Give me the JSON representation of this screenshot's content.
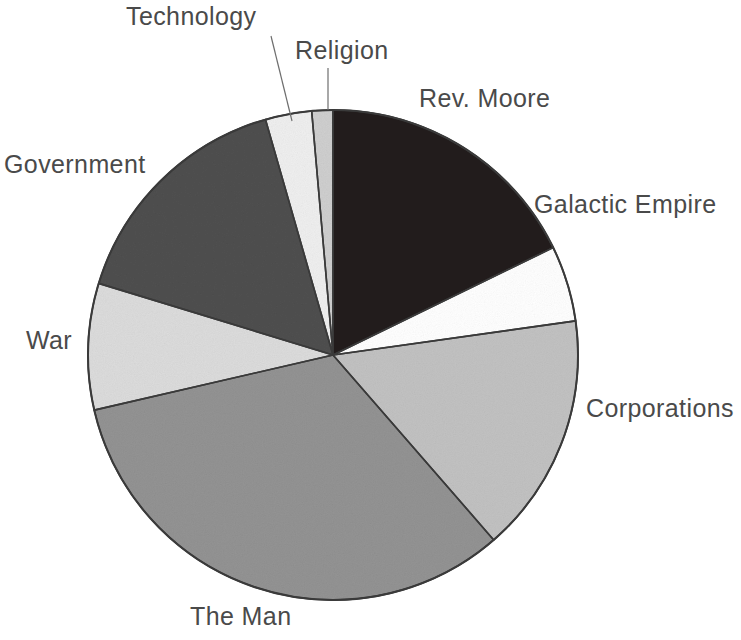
{
  "chart_data": {
    "type": "pie",
    "title": "",
    "subtitle": "",
    "xlabel": "",
    "ylabel": "",
    "legend_position": "none",
    "grid": false,
    "labels_outside": true,
    "start_angle_deg": 0,
    "direction": "clockwise",
    "center": {
      "x": 333,
      "y": 355
    },
    "radius": 245,
    "categories": [
      "Rev. Moore",
      "Galactic Empire",
      "Corporations",
      "The Man",
      "War",
      "Government",
      "Technology",
      "Religion"
    ],
    "values": [
      17.8,
      5.0,
      15.8,
      32.8,
      8.3,
      15.8,
      3.1,
      1.4
    ],
    "slices": [
      {
        "label": "Rev. Moore",
        "value": 17.8,
        "start_deg": 0,
        "end_deg": 64,
        "color": "#221f1f",
        "swatch_name": "near-black"
      },
      {
        "label": "Galactic Empire",
        "value": 5.0,
        "start_deg": 64,
        "end_deg": 82,
        "color": "#ffffff",
        "swatch_name": "white"
      },
      {
        "label": "Corporations",
        "value": 15.8,
        "start_deg": 82,
        "end_deg": 139,
        "color": "#c2c2c2",
        "swatch_name": "light-gray"
      },
      {
        "label": "The Man",
        "value": 32.8,
        "start_deg": 139,
        "end_deg": 257,
        "color": "#939393",
        "swatch_name": "medium-gray"
      },
      {
        "label": "War",
        "value": 8.3,
        "start_deg": 257,
        "end_deg": 287,
        "color": "#dcdcdc",
        "swatch_name": "very-light-gray"
      },
      {
        "label": "Government",
        "value": 15.8,
        "start_deg": 287,
        "end_deg": 344,
        "color": "#4f4f4f",
        "swatch_name": "dark-gray"
      },
      {
        "label": "Technology",
        "value": 3.1,
        "start_deg": 344,
        "end_deg": 355,
        "color": "#efefef",
        "swatch_name": "off-white"
      },
      {
        "label": "Religion",
        "value": 1.4,
        "start_deg": 355,
        "end_deg": 360,
        "color": "#cfcfcf",
        "swatch_name": "light-gray-sliver"
      }
    ],
    "leader_lines": [
      {
        "label": "Technology",
        "from": {
          "x": 271,
          "y": 36
        },
        "to": {
          "x": 292,
          "y": 121
        }
      },
      {
        "label": "Religion",
        "from": {
          "x": 328,
          "y": 68
        },
        "to": {
          "x": 328,
          "y": 110
        }
      }
    ]
  },
  "labels": {
    "technology": "Technology",
    "religion": "Religion",
    "rev_moore": "Rev. Moore",
    "galactic_empire": "Galactic Empire",
    "corporations": "Corporations",
    "the_man": "The Man",
    "war": "War",
    "government": "Government"
  },
  "style": {
    "background": "#ffffff",
    "label_color": "#4a4a4a",
    "outline_color": "#3a3a3a",
    "leader_line_color": "#6e6e6e"
  }
}
